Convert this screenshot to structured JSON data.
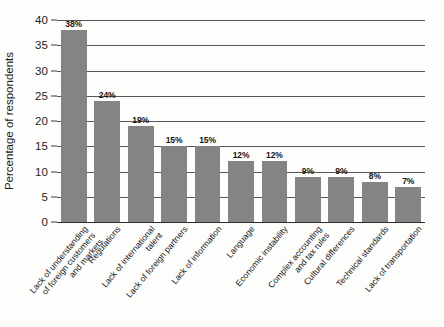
{
  "chart_data": {
    "type": "bar",
    "title": "",
    "xlabel": "",
    "ylabel": "Percentage of respondents",
    "ylim": [
      0,
      40
    ],
    "yticks": [
      0,
      5,
      10,
      15,
      20,
      25,
      30,
      35,
      40
    ],
    "ytick_labels": [
      "0",
      "5",
      "10",
      "15",
      "20",
      "25",
      "30",
      "35",
      "40"
    ],
    "grid": true,
    "legend": "none",
    "bar_color": "#848484",
    "categories": [
      "Lack of understanding of foreign customers and markets",
      "Regulations",
      "Lack of international talent",
      "Lack of foreign partners",
      "Lack of information",
      "Language",
      "Economic instability",
      "Complex accounting and tax rules",
      "Cultural differences",
      "Technical standards",
      "Lack of transportation"
    ],
    "category_label_lines": [
      [
        "Lack of understanding",
        "of foreign customers",
        "and markets"
      ],
      [
        "Regulations"
      ],
      [
        "Lack of international",
        "talent"
      ],
      [
        "Lack of foreign partners"
      ],
      [
        "Lack of information"
      ],
      [
        "Language"
      ],
      [
        "Economic instability"
      ],
      [
        "Complex accounting",
        "and tax rules"
      ],
      [
        "Cultural differences"
      ],
      [
        "Technical standards"
      ],
      [
        "Lack of transportation"
      ]
    ],
    "values": [
      38,
      24,
      19,
      15,
      15,
      12,
      12,
      9,
      9,
      8,
      7
    ],
    "value_labels": [
      "38%",
      "24%",
      "19%",
      "15%",
      "15%",
      "12%",
      "12%",
      "9%",
      "9%",
      "8%",
      "7%"
    ]
  }
}
